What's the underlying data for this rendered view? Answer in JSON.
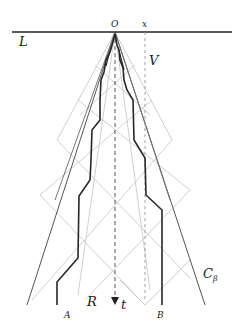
{
  "diagram": {
    "labels": {
      "L": "L",
      "O": "O",
      "x": "x",
      "V": "V",
      "t": "t",
      "R": "R",
      "A": "A",
      "B": "B",
      "C": "C",
      "beta": "β"
    },
    "colors": {
      "axis": "#222222",
      "dark_path": "#2a2a2a",
      "cone": "#555555",
      "light_grid": "#c8c8c8",
      "dashed": "#888888"
    }
  }
}
